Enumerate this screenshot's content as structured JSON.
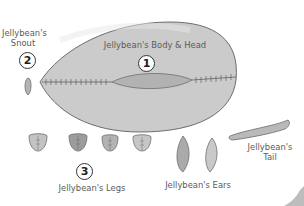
{
  "diagram": {
    "colors": {
      "piece_fill": "#c9c9c9",
      "piece_fill_dark": "#a9a9a9",
      "outline": "#6d6d6d",
      "text": "#5a5a5a",
      "number_ring": "#333333"
    },
    "pieces": [
      {
        "id": "body",
        "number": "1",
        "label": "Jellybean's Body & Head"
      },
      {
        "id": "snout",
        "number": "2",
        "label_line1": "Jellybean's",
        "label_line2": "Snout"
      },
      {
        "id": "legs",
        "number": "3",
        "label": "Jellybean's Legs",
        "count": 4
      },
      {
        "id": "ears",
        "label": "Jellybean's Ears",
        "count": 2
      },
      {
        "id": "tail",
        "label_line1": "Jellybean's",
        "label_line2": "Tail"
      }
    ]
  }
}
